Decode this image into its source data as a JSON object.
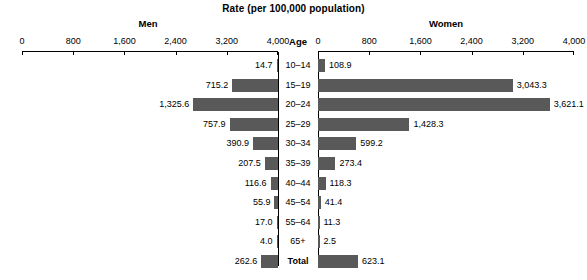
{
  "chart_data": {
    "type": "bar",
    "title": "Rate (per 100,000 population)",
    "subtype": "population-pyramid",
    "xlabel": "Rate (per 100,000 population)",
    "ylabel": "Age",
    "categories": [
      "10–14",
      "15–19",
      "20–24",
      "25–29",
      "30–34",
      "35–39",
      "40–44",
      "45–54",
      "55–64",
      "65+",
      "Total"
    ],
    "series": [
      {
        "name": "Men",
        "side": "left",
        "values": [
          14.7,
          715.2,
          1325.6,
          757.9,
          390.9,
          207.5,
          116.6,
          55.9,
          17.0,
          4.0,
          262.6
        ],
        "labels": [
          "14.7",
          "715.2",
          "1,325.6",
          "757.9",
          "390.9",
          "207.5",
          "116.6",
          "55.9",
          "17.0",
          "4.0",
          "262.6"
        ]
      },
      {
        "name": "Women",
        "side": "right",
        "values": [
          108.9,
          3043.3,
          3621.1,
          1428.3,
          599.2,
          273.4,
          118.3,
          41.4,
          11.3,
          2.5,
          623.1
        ],
        "labels": [
          "108.9",
          "3,043.3",
          "3,621.1",
          "1,428.3",
          "599.2",
          "273.4",
          "118.3",
          "41.4",
          "11.3",
          "2.5",
          "623.1"
        ]
      }
    ],
    "axis": {
      "min": 0,
      "max": 4000,
      "tick_values": [
        0,
        800,
        1600,
        2400,
        3200,
        4000
      ],
      "left_tick_labels": [
        "4,000",
        "3,200",
        "2,400",
        "1,600",
        "800",
        "0"
      ],
      "right_tick_labels": [
        "0",
        "800",
        "1,600",
        "2,400",
        "3,200",
        "4,000"
      ],
      "grid": false
    },
    "legend": "none",
    "bar_color": "#595959",
    "axis_color": "#000000",
    "background": "#ffffff"
  },
  "headers": {
    "men": "Men",
    "women": "Women",
    "age": "Age"
  }
}
